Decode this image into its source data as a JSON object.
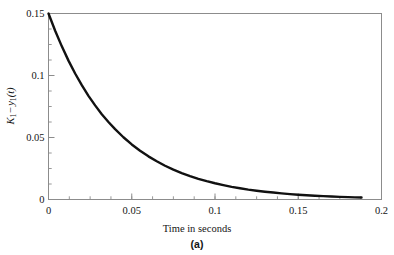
{
  "chart_data": {
    "type": "line",
    "title": "",
    "subtitle": "",
    "caption": "(a)",
    "xlabel": "Time in seconds",
    "ylabel": "K1 - y1(t)",
    "ylabel_parts": {
      "var1": "K",
      "var1_sub": "1",
      "operator": "−",
      "var2": "y",
      "var2_sub": "1",
      "arg": "(t)"
    },
    "xlim": [
      0,
      0.2
    ],
    "ylim": [
      0,
      0.15
    ],
    "grid": false,
    "legend": false,
    "legend_position": "none",
    "x_ticks": [
      0,
      0.05,
      0.1,
      0.15,
      0.2
    ],
    "x_tick_labels": [
      "0",
      "0.05",
      "0.1",
      "0.15",
      "0.2"
    ],
    "x_minor_tick_step": 0.0125,
    "y_ticks": [
      0,
      0.05,
      0.1,
      0.15
    ],
    "y_tick_labels": [
      "0",
      "0.05",
      "0.1",
      "0.15"
    ],
    "y_minor_tick_step": 0.0125,
    "series": [
      {
        "name": "K1 - y1(t)",
        "color": "#111111",
        "line_width": 2.4,
        "x": [
          0,
          0.004,
          0.008,
          0.012,
          0.016,
          0.02,
          0.024,
          0.028,
          0.032,
          0.036,
          0.04,
          0.045,
          0.05,
          0.055,
          0.06,
          0.065,
          0.07,
          0.075,
          0.08,
          0.085,
          0.09,
          0.095,
          0.1,
          0.105,
          0.11,
          0.115,
          0.12,
          0.125,
          0.13,
          0.135,
          0.14,
          0.145,
          0.15,
          0.155,
          0.16,
          0.165,
          0.17,
          0.175,
          0.18,
          0.184,
          0.188
        ],
        "y": [
          0.15,
          0.1361,
          0.1235,
          0.112,
          0.1016,
          0.0922,
          0.0836,
          0.0759,
          0.0688,
          0.0625,
          0.0567,
          0.0502,
          0.0444,
          0.0393,
          0.0348,
          0.0308,
          0.0272,
          0.0241,
          0.0213,
          0.0189,
          0.0167,
          0.0148,
          0.0131,
          0.0116,
          0.0102,
          0.0091,
          0.008,
          0.0071,
          0.0063,
          0.0056,
          0.0049,
          0.0043,
          0.0038,
          0.0034,
          0.003,
          0.0027,
          0.0024,
          0.0021,
          0.0019,
          0.0017,
          0.0016
        ]
      }
    ],
    "annotations": []
  },
  "axis_style": {
    "frame_color": "#8c8c8c",
    "tick_color": "#8c8c8c",
    "text_color": "#141414",
    "background": "#ffffff"
  }
}
